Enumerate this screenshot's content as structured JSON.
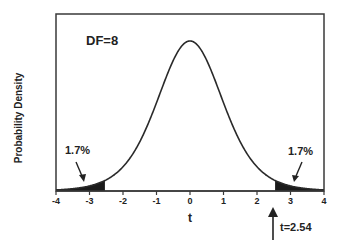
{
  "chart_data": {
    "type": "area",
    "title": "",
    "annotation_df": "DF=8",
    "df": 8,
    "xlabel": "t",
    "ylabel": "Probability Density",
    "xlim": [
      -4,
      4
    ],
    "x_ticks": [
      -4,
      -3,
      -2,
      -1,
      0,
      1,
      2,
      3,
      4
    ],
    "x_tick_labels": [
      "-4",
      "-3",
      "-2",
      "-1",
      "0",
      "1",
      "2",
      "3",
      "4"
    ],
    "grid": false,
    "legend": null,
    "curve": "Student t distribution probability density, df=8",
    "shaded_regions": [
      {
        "from": -4,
        "to": -2.54,
        "label": "1.7%"
      },
      {
        "from": 2.54,
        "to": 4,
        "label": "1.7%"
      }
    ],
    "annotations": [
      {
        "text": "1.7%",
        "arrow_to_x": -3.2,
        "side": "left"
      },
      {
        "text": "1.7%",
        "arrow_to_x": 3.2,
        "side": "right"
      },
      {
        "text": "t=2.54",
        "arrow_at_x": 2.54,
        "direction": "up"
      }
    ]
  },
  "labels": {
    "df": "DF=8",
    "ylabel": "Probability Density",
    "xlabel": "t",
    "left_pct": "1.7%",
    "right_pct": "1.7%",
    "tcrit": "t=2.54"
  },
  "ticks": [
    "-4",
    "-3",
    "-2",
    "-1",
    "0",
    "1",
    "2",
    "3",
    "4"
  ],
  "colors": {
    "line": "#2a2a2a",
    "fill": "#1a1a1a",
    "text": "#222222"
  }
}
